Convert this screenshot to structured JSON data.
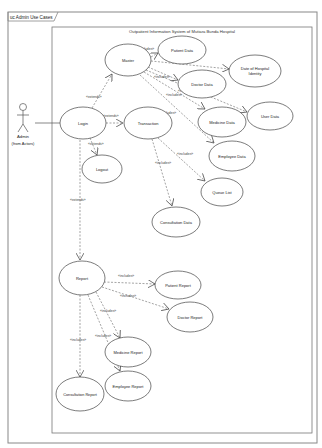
{
  "frame": {
    "tab_label": "uc Admin Use Cases"
  },
  "system": {
    "title": "Outpatient Information System of Mutiara Bunda Hospital"
  },
  "actor": {
    "name": "Admin",
    "package": "(from Actors)"
  },
  "use_cases": [
    {
      "id": "master",
      "label": "Master",
      "cx": 128,
      "cy": 60,
      "rx": 23,
      "ry": 16
    },
    {
      "id": "patient-data",
      "label": "Patient Data",
      "cx": 182,
      "cy": 50,
      "rx": 24,
      "ry": 14
    },
    {
      "id": "date-of-hospital-identity",
      "label": "Date of Hospital",
      "label2": "Identity",
      "cx": 255,
      "cy": 71,
      "rx": 26,
      "ry": 16
    },
    {
      "id": "doctor-data",
      "label": "Doctor Data",
      "cx": 202,
      "cy": 84,
      "rx": 24,
      "ry": 14
    },
    {
      "id": "login",
      "label": "Login",
      "cx": 83,
      "cy": 123,
      "rx": 23,
      "ry": 16
    },
    {
      "id": "transaction",
      "label": "Transaction",
      "cx": 148,
      "cy": 123,
      "rx": 24,
      "ry": 16
    },
    {
      "id": "medicine-data",
      "label": "Medicine Data",
      "cx": 222,
      "cy": 122,
      "rx": 24,
      "ry": 15
    },
    {
      "id": "user-data",
      "label": "User Data",
      "cx": 270,
      "cy": 116,
      "rx": 23,
      "ry": 14
    },
    {
      "id": "logout",
      "label": "Logout",
      "cx": 102,
      "cy": 169,
      "rx": 20,
      "ry": 14
    },
    {
      "id": "employee-data",
      "label": "Employee Data",
      "cx": 232,
      "cy": 156,
      "rx": 23,
      "ry": 15
    },
    {
      "id": "queue-list",
      "label": "Queue List",
      "cx": 222,
      "cy": 192,
      "rx": 21,
      "ry": 14
    },
    {
      "id": "consultation-data",
      "label": "Consultation Data",
      "cx": 176,
      "cy": 222,
      "rx": 24,
      "ry": 15
    },
    {
      "id": "report",
      "label": "Report",
      "cx": 82,
      "cy": 278,
      "rx": 23,
      "ry": 17
    },
    {
      "id": "patient-report",
      "label": "Patient Report",
      "cx": 178,
      "cy": 285,
      "rx": 23,
      "ry": 14
    },
    {
      "id": "doctor-report",
      "label": "Doctor Report",
      "cx": 190,
      "cy": 317,
      "rx": 23,
      "ry": 15
    },
    {
      "id": "medicine-report",
      "label": "Medicine Report",
      "cx": 128,
      "cy": 352,
      "rx": 23,
      "ry": 15
    },
    {
      "id": "consultation-report",
      "label": "Consultation Report",
      "cx": 80,
      "cy": 394,
      "rx": 24,
      "ry": 17
    },
    {
      "id": "employee-report",
      "label": "Employee Report",
      "cx": 128,
      "cy": 386,
      "rx": 23,
      "ry": 15
    }
  ],
  "relations": [
    {
      "from": "login",
      "to": "master",
      "stereotype": "«extends»"
    },
    {
      "from": "login",
      "to": "transaction",
      "stereotype": "«extends»"
    },
    {
      "from": "login",
      "to": "logout",
      "stereotype": "«extends»"
    },
    {
      "from": "login",
      "to": "report",
      "stereotype": "«extends»"
    },
    {
      "from": "master",
      "to": "patient-data",
      "stereotype": "«includes»"
    },
    {
      "from": "master",
      "to": "date-of-hospital-identity",
      "stereotype": "«includes»"
    },
    {
      "from": "master",
      "to": "doctor-data",
      "stereotype": "«includes»"
    },
    {
      "from": "master",
      "to": "medicine-data",
      "stereotype": "«includes»"
    },
    {
      "from": "master",
      "to": "user-data",
      "stereotype": "«includes»"
    },
    {
      "from": "master",
      "to": "employee-data",
      "stereotype": "«includes»"
    },
    {
      "from": "transaction",
      "to": "queue-list",
      "stereotype": "«includes»"
    },
    {
      "from": "transaction",
      "to": "consultation-data",
      "stereotype": "«includes»"
    },
    {
      "from": "report",
      "to": "patient-report",
      "stereotype": "«includes»"
    },
    {
      "from": "report",
      "to": "doctor-report",
      "stereotype": "«includes»"
    },
    {
      "from": "report",
      "to": "medicine-report",
      "stereotype": "«includes»"
    },
    {
      "from": "report",
      "to": "employee-report",
      "stereotype": "«includes»"
    },
    {
      "from": "report",
      "to": "consultation-report",
      "stereotype": "«includes»"
    }
  ],
  "colors": {
    "line": "#555555",
    "text": "#222222",
    "frame": "#888888"
  }
}
